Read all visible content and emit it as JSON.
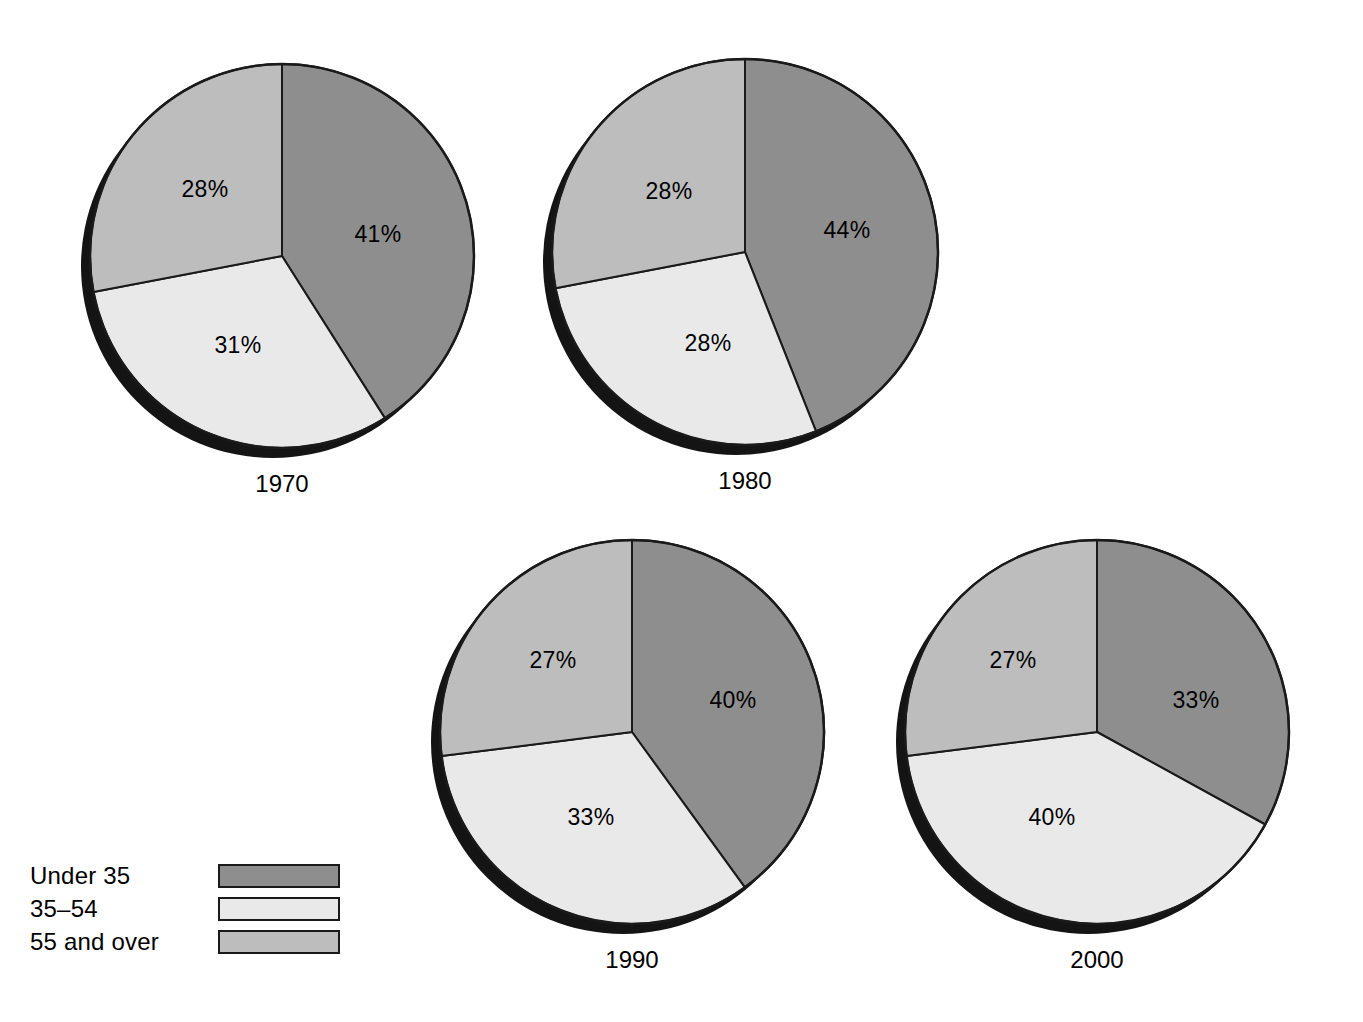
{
  "figure": {
    "background_color": "#ffffff",
    "outline_color": "#1a1a1a",
    "shadow_color": "#141414"
  },
  "legend": {
    "name": "age-group-legend",
    "items": [
      {
        "label": "Under 35",
        "color": "#8e8e8e",
        "swatch_name": "legend-swatch-under-35"
      },
      {
        "label": "35–54",
        "color": "#e9e9e9",
        "swatch_name": "legend-swatch-35-54"
      },
      {
        "label": "55 and over",
        "color": "#bdbdbd",
        "swatch_name": "legend-swatch-55-and-over"
      }
    ]
  },
  "chart_data": {
    "type": "pie",
    "title": "",
    "subtitle": "",
    "xlabel": "",
    "ylabel": "",
    "grid": false,
    "legend_position": "bottom-left",
    "units": "percent",
    "categories": [
      "Under 35",
      "35–54",
      "55 and over"
    ],
    "colors": [
      "#8e8e8e",
      "#e9e9e9",
      "#bdbdbd"
    ],
    "start_angle_deg": 0,
    "direction": "clockwise",
    "panels": [
      {
        "year": "1970",
        "caption": "1970",
        "cx": 282,
        "cy": 256,
        "r": 192,
        "values": [
          41,
          31,
          28
        ],
        "labels": [
          "41%",
          "31%",
          "28%"
        ],
        "label_positions": [
          {
            "x": 378,
            "y": 236
          },
          {
            "x": 238,
            "y": 347
          },
          {
            "x": 205,
            "y": 191
          }
        ]
      },
      {
        "year": "1980",
        "caption": "1980",
        "cx": 745,
        "cy": 252,
        "r": 193,
        "values": [
          44,
          28,
          28
        ],
        "labels": [
          "44%",
          "28%",
          "28%"
        ],
        "label_positions": [
          {
            "x": 847,
            "y": 232
          },
          {
            "x": 708,
            "y": 345
          },
          {
            "x": 669,
            "y": 193
          }
        ]
      },
      {
        "year": "1990",
        "caption": "1990",
        "cx": 632,
        "cy": 732,
        "r": 192,
        "values": [
          40,
          33,
          27
        ],
        "labels": [
          "40%",
          "33%",
          "27%"
        ],
        "label_positions": [
          {
            "x": 733,
            "y": 702
          },
          {
            "x": 591,
            "y": 819
          },
          {
            "x": 553,
            "y": 662
          }
        ]
      },
      {
        "year": "2000",
        "caption": "2000",
        "cx": 1097,
        "cy": 732,
        "r": 192,
        "values": [
          33,
          40,
          27
        ],
        "labels": [
          "33%",
          "40%",
          "27%"
        ],
        "label_positions": [
          {
            "x": 1196,
            "y": 702
          },
          {
            "x": 1052,
            "y": 819
          },
          {
            "x": 1013,
            "y": 662
          }
        ]
      }
    ]
  }
}
